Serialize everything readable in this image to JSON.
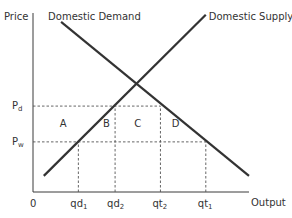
{
  "chart_data": {
    "type": "line",
    "title": "",
    "xlabel": "Output",
    "ylabel": "Price",
    "origin_label": "0",
    "grid": false,
    "xlim": [
      0,
      10
    ],
    "ylim": [
      0,
      10
    ],
    "series": [
      {
        "name": "Domestic Demand",
        "label": "Domestic Demand",
        "points": [
          [
            1.3,
            9.5
          ],
          [
            10.0,
            0.9
          ]
        ]
      },
      {
        "name": "Domestic Supply",
        "label": "Domestic Supply",
        "points": [
          [
            0.5,
            0.9
          ],
          [
            8.0,
            9.9
          ]
        ]
      }
    ],
    "price_levels": [
      {
        "name": "pd",
        "label": "P",
        "sub": "d",
        "y": 4.8
      },
      {
        "name": "pw",
        "label": "P",
        "sub": "w",
        "y": 2.8
      }
    ],
    "quantity_levels": [
      {
        "name": "qd1",
        "label": "qd",
        "sub": "1",
        "x": 2.1
      },
      {
        "name": "qd2",
        "label": "qd",
        "sub": "2",
        "x": 3.8
      },
      {
        "name": "qt2",
        "label": "qt",
        "sub": "2",
        "x": 5.9
      },
      {
        "name": "qt1",
        "label": "qt",
        "sub": "1",
        "x": 8.0
      }
    ],
    "dashed_guides": [
      {
        "type": "h",
        "y": 4.8,
        "x_from": 0,
        "x_to": 5.9
      },
      {
        "type": "h",
        "y": 2.8,
        "x_from": 0,
        "x_to": 8.0
      },
      {
        "type": "v",
        "x": 2.1,
        "y_from": 0,
        "y_to": 2.8
      },
      {
        "type": "v",
        "x": 3.8,
        "y_from": 0,
        "y_to": 4.8
      },
      {
        "type": "v",
        "x": 5.9,
        "y_from": 0,
        "y_to": 4.8
      },
      {
        "type": "v",
        "x": 8.0,
        "y_from": 0,
        "y_to": 2.8
      }
    ],
    "area_labels": [
      {
        "text": "A",
        "x": 1.4,
        "y": 3.8
      },
      {
        "text": "B",
        "x": 3.4,
        "y": 3.8
      },
      {
        "text": "C",
        "x": 4.85,
        "y": 3.8
      },
      {
        "text": "D",
        "x": 6.6,
        "y": 3.8
      }
    ]
  }
}
